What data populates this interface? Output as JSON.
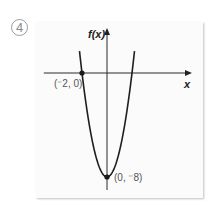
{
  "problem_number": "4",
  "chart_data": {
    "type": "line",
    "title": "",
    "function": "f(x) = 2x^2 - 8",
    "xlabel": "x",
    "ylabel": "f(x)",
    "xlim": [
      -2.9,
      6.6
    ],
    "ylim": [
      -8.9,
      3.3
    ],
    "grid": false,
    "series": [
      {
        "name": "f(x)",
        "x": [
          -2.2,
          -2,
          -1.5,
          -1,
          -0.5,
          0,
          0.5,
          1,
          1.5,
          2,
          2.2
        ],
        "values": [
          1.68,
          0,
          -3.5,
          -6,
          -7.5,
          -8,
          -7.5,
          -6,
          -3.5,
          0,
          1.68
        ]
      }
    ],
    "points": [
      {
        "x": -2,
        "y": 0,
        "label": "(⁻2, 0)"
      },
      {
        "x": 0,
        "y": -8,
        "label": "(0, ⁻8)"
      }
    ],
    "colors": {
      "curve": "#1e1e1e",
      "axis": "#2a2a2a",
      "label": "#555555"
    }
  }
}
